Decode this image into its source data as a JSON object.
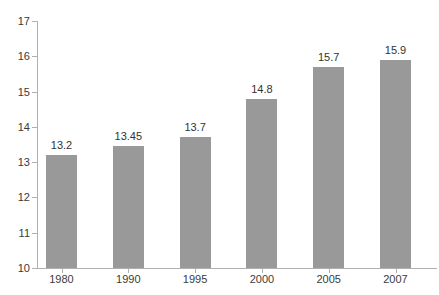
{
  "chart_data": {
    "type": "bar",
    "title": "",
    "subtitle": "",
    "xlabel": "",
    "ylabel": "",
    "categories": [
      "1980",
      "1990",
      "1995",
      "2000",
      "2005",
      "2007"
    ],
    "values": [
      13.2,
      13.45,
      13.7,
      14.8,
      15.7,
      15.9
    ],
    "data_labels": [
      "13.2",
      "13.45",
      "13.7",
      "14.8",
      "15.7",
      "15.9"
    ],
    "series": [
      {
        "name": "",
        "values": [
          13.2,
          13.45,
          13.7,
          14.8,
          15.7,
          15.9
        ]
      }
    ],
    "ylim": [
      10,
      17
    ],
    "yticks": [
      10,
      11,
      12,
      13,
      14,
      15,
      16,
      17
    ],
    "ytick_labels": [
      "10",
      "11",
      "12",
      "13",
      "14",
      "15",
      "16",
      "17"
    ],
    "grid": false,
    "legend": false,
    "legend_position": "none",
    "colors": {
      "bar": "#999999",
      "axis": "#b0b0b0",
      "text": "#333333",
      "background": "#ffffff"
    }
  }
}
